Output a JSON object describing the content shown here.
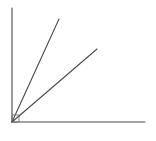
{
  "diagram": {
    "origin": {
      "x": 12,
      "y": 122
    },
    "stroke_color": "#4a4a4a",
    "axes": {
      "vertical": {
        "x1": 12,
        "y1": 8,
        "x2": 12,
        "y2": 122
      },
      "horizontal": {
        "x1": 12,
        "y1": 122,
        "x2": 145,
        "y2": 122
      }
    },
    "rays": [
      {
        "name": "steep-ray",
        "x1": 12,
        "y1": 122,
        "x2": 59,
        "y2": 19
      },
      {
        "name": "shallow-ray",
        "x1": 12,
        "y1": 122,
        "x2": 97,
        "y2": 49
      }
    ],
    "right_angle_marker": {
      "x": 12,
      "y": 115,
      "size": 7
    }
  }
}
